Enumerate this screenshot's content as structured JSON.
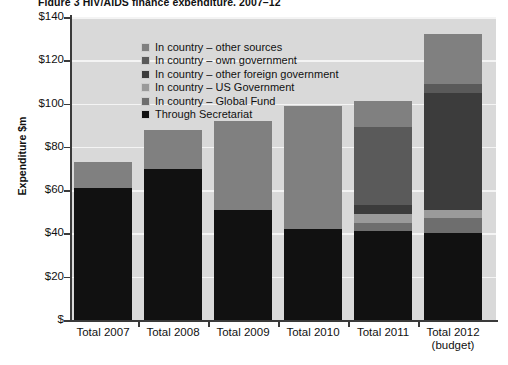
{
  "figure": {
    "title": "Figure 3  HIV/AIDS finance expenditure, 2007–12"
  },
  "axes": {
    "y_axis_title": "Expenditure $m",
    "y_ticks": [
      "$140",
      "$120",
      "$100",
      "$80",
      "$60",
      "$40",
      "$20",
      "$"
    ],
    "y_tick_values": [
      140,
      120,
      100,
      80,
      60,
      40,
      20,
      0
    ],
    "x_labels": [
      {
        "line1": "Total 2007",
        "line2": ""
      },
      {
        "line1": "Total 2008",
        "line2": ""
      },
      {
        "line1": "Total 2009",
        "line2": ""
      },
      {
        "line1": "Total 2010",
        "line2": ""
      },
      {
        "line1": "Total 2011",
        "line2": ""
      },
      {
        "line1": "Total 2012",
        "line2": "(budget)"
      }
    ]
  },
  "legend": {
    "items": [
      {
        "label": "In country – other sources",
        "color": "#808080"
      },
      {
        "label": "In country – own government",
        "color": "#5a5a5a"
      },
      {
        "label": "In country – other foreign government",
        "color": "#3c3c3c"
      },
      {
        "label": "In country – US Government",
        "color": "#9a9a9a"
      },
      {
        "label": "In country – Global Fund",
        "color": "#6e6e6e"
      },
      {
        "label": "Through Secretariat",
        "color": "#111111"
      }
    ]
  },
  "colors": {
    "plot_background": "#d9d9d9",
    "gridline": "#f4f4f4",
    "axis": "#3a3a3a",
    "page_background": "#ffffff"
  },
  "chart_data": {
    "type": "bar",
    "subtype": "stacked",
    "title": "Figure 3  HIV/AIDS finance expenditure, 2007–12",
    "xlabel": "",
    "ylabel": "Expenditure $m",
    "ylim": [
      0,
      140
    ],
    "ytick_interval": 20,
    "grid": true,
    "legend_position": "inside-top-left",
    "categories": [
      "Total 2007",
      "Total 2008",
      "Total 2009",
      "Total 2010",
      "Total 2011",
      "Total 2012 (budget)"
    ],
    "series": [
      {
        "name": "Through Secretariat",
        "color": "#111111",
        "values": [
          61,
          70,
          51,
          42,
          41,
          40
        ]
      },
      {
        "name": "In country – Global Fund",
        "color": "#6e6e6e",
        "values": [
          0,
          0,
          0,
          0,
          4,
          7
        ]
      },
      {
        "name": "In country – US Government",
        "color": "#9a9a9a",
        "values": [
          0,
          0,
          0,
          0,
          4,
          4
        ]
      },
      {
        "name": "In country – other foreign government",
        "color": "#3c3c3c",
        "values": [
          0,
          0,
          0,
          0,
          4,
          54
        ]
      },
      {
        "name": "In country – own government",
        "color": "#5a5a5a",
        "values": [
          0,
          0,
          0,
          0,
          36,
          4
        ]
      },
      {
        "name": "In country – other sources",
        "color": "#808080",
        "values": [
          12,
          18,
          41,
          57,
          12,
          23
        ]
      }
    ],
    "totals": [
      73,
      88,
      92,
      99,
      101,
      132
    ]
  }
}
